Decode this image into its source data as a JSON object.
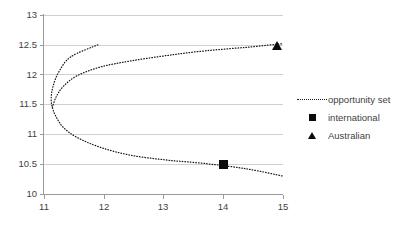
{
  "chart_data": {
    "type": "line",
    "title": "",
    "xlabel": "",
    "ylabel": "",
    "xlim": [
      11,
      15
    ],
    "ylim": [
      10,
      13
    ],
    "grid": true,
    "legend_position": "right",
    "x_ticks": [
      "11",
      "12",
      "13",
      "14",
      "15"
    ],
    "x_tick_values": [
      11,
      12,
      13,
      14,
      15
    ],
    "y_ticks": [
      "10",
      "10.5",
      "11",
      "11.5",
      "12",
      "12.5",
      "13"
    ],
    "y_tick_values": [
      10,
      10.5,
      11,
      11.5,
      12,
      12.5,
      13
    ],
    "series": [
      {
        "name": "opportunity set",
        "style": "dotted-line",
        "marker": "none",
        "color": "#1a1a1a",
        "comment": "sideways parabola opening right; vertex near (11.15, 11.42)",
        "points": [
          [
            11.9,
            12.5
          ],
          [
            11.45,
            12.3
          ],
          [
            11.25,
            12.05
          ],
          [
            11.15,
            11.8
          ],
          [
            11.12,
            11.6
          ],
          [
            11.14,
            11.45
          ],
          [
            11.2,
            11.3
          ],
          [
            11.32,
            11.12
          ],
          [
            11.55,
            10.95
          ],
          [
            11.95,
            10.78
          ],
          [
            12.45,
            10.65
          ],
          [
            13.05,
            10.57
          ],
          [
            13.7,
            10.51
          ],
          [
            14.4,
            10.42
          ],
          [
            15.0,
            10.3
          ]
        ],
        "upper_branch": [
          [
            11.14,
            11.45
          ],
          [
            11.2,
            11.62
          ],
          [
            11.32,
            11.8
          ],
          [
            11.55,
            11.98
          ],
          [
            11.95,
            12.13
          ],
          [
            12.45,
            12.23
          ],
          [
            13.05,
            12.32
          ],
          [
            13.7,
            12.4
          ],
          [
            14.4,
            12.46
          ],
          [
            15.0,
            12.52
          ]
        ]
      },
      {
        "name": "international",
        "style": "marker-only",
        "marker": "square",
        "color": "#0a0a0a",
        "points": [
          [
            14.0,
            10.49
          ]
        ]
      },
      {
        "name": "Australian",
        "style": "marker-only",
        "marker": "triangle",
        "color": "#0a0a0a",
        "points": [
          [
            14.9,
            12.48
          ]
        ]
      }
    ],
    "legend_entries": [
      {
        "label": "opportunity set",
        "key": "dotted-line"
      },
      {
        "label": "international",
        "key": "square"
      },
      {
        "label": "Australian",
        "key": "triangle"
      }
    ]
  },
  "legend": {
    "items": [
      {
        "label": "opportunity set"
      },
      {
        "label": "international"
      },
      {
        "label": "Australian"
      }
    ]
  },
  "axes": {
    "x_labels": [
      "11",
      "12",
      "13",
      "14",
      "15"
    ],
    "y_labels": [
      "13",
      "12.5",
      "12",
      "11.5",
      "11",
      "10.5",
      "10"
    ]
  }
}
